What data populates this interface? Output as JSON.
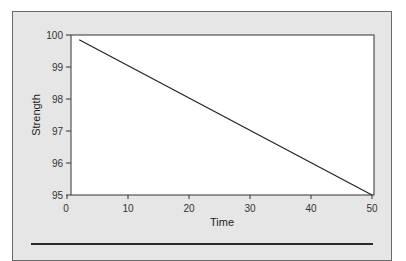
{
  "chart_data": {
    "type": "line",
    "title": "",
    "xlabel": "Time",
    "ylabel": "Strength",
    "xlim": [
      0,
      50
    ],
    "ylim": [
      95,
      100
    ],
    "x_ticks": [
      "0",
      "10",
      "20",
      "30",
      "40",
      "50"
    ],
    "y_ticks": [
      "95",
      "96",
      "97",
      "98",
      "99",
      "100"
    ],
    "grid": false,
    "legend": null,
    "series": [
      {
        "name": "Strength",
        "x": [
          2,
          50
        ],
        "values": [
          99.85,
          95.0
        ],
        "color": "#222222"
      }
    ]
  },
  "colors": {
    "panel_background": "#e6e6e6",
    "plot_background": "#ffffff",
    "line": "#222222"
  }
}
